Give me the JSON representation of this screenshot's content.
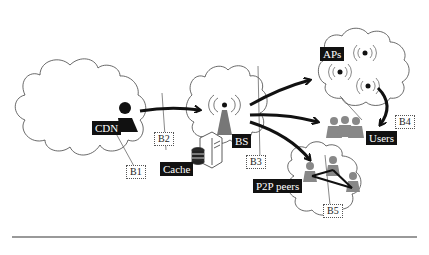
{
  "diagram": {
    "nodes": {
      "cdn": "CDN",
      "cache": "Cache",
      "bs": "BS",
      "aps": "APs",
      "users": "Users",
      "p2p": "P2P peers"
    },
    "boundaries": {
      "b1": "B1",
      "b2": "B2",
      "b3": "B3",
      "b4": "B4",
      "b5": "B5"
    },
    "colors": {
      "label_bg": "#111111",
      "label_text": "#ffffff",
      "person_gray": "#888888",
      "line": "#111111"
    }
  }
}
